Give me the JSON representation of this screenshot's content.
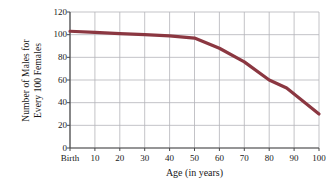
{
  "chart_data": {
    "type": "line",
    "title": "",
    "xlabel": "Age (in years)",
    "ylabel_line1": "Number of Males for",
    "ylabel_line2": "Every 100 Females",
    "ylabel": "Number of Males for Every 100 Females",
    "xlim": [
      0,
      100
    ],
    "ylim": [
      0,
      120
    ],
    "xticks": [
      0,
      10,
      20,
      30,
      40,
      50,
      60,
      70,
      80,
      90,
      100
    ],
    "xticklabels": [
      "Birth",
      "10",
      "20",
      "30",
      "40",
      "50",
      "60",
      "70",
      "80",
      "90",
      "100"
    ],
    "yticks": [
      0,
      20,
      40,
      60,
      80,
      100,
      120
    ],
    "yticklabels": [
      "0",
      "20",
      "40",
      "60",
      "80",
      "100",
      "120"
    ],
    "grid": true,
    "legend": "none",
    "series": [
      {
        "name": "Males per 100 females",
        "color": "#8B3741",
        "x": [
          0,
          10,
          20,
          30,
          40,
          50,
          60,
          70,
          80,
          87,
          100
        ],
        "values": [
          103,
          102,
          101,
          100,
          99,
          97,
          88,
          76,
          60,
          53,
          30
        ]
      }
    ],
    "line_color": "#8B3741",
    "grid_color": "#b4b4b9",
    "axis_color": "#4a4a4a",
    "background": "#ffffff"
  }
}
